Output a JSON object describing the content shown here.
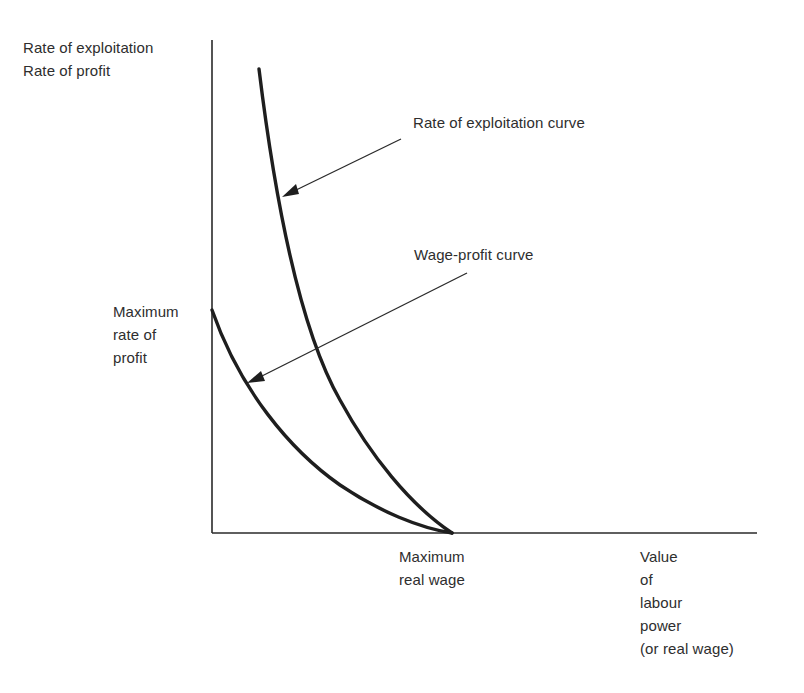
{
  "diagram": {
    "y_axis_label": {
      "lines": [
        "Rate of exploitation",
        "Rate of profit"
      ]
    },
    "y_marker_label": {
      "lines": [
        "Maximum",
        "rate of",
        "profit"
      ]
    },
    "x_marker_label": {
      "lines": [
        "Maximum",
        "real wage"
      ]
    },
    "x_axis_label": {
      "lines": [
        "Value",
        "of",
        "labour",
        "power",
        "(or real wage)"
      ]
    },
    "annotations": {
      "exploitation_curve": "Rate of exploitation curve",
      "wage_profit_curve": "Wage-profit curve"
    },
    "curves": [
      {
        "name": "Rate of exploitation curve",
        "start": "top (high, near vertical)",
        "end": "Maximum real wage on x-axis"
      },
      {
        "name": "Wage-profit curve",
        "start": "Maximum rate of profit on y-axis",
        "end": "Maximum real wage on x-axis"
      }
    ],
    "colors": {
      "line": "#1e1e1e",
      "text": "#2e2e2e",
      "background": "#ffffff"
    }
  }
}
